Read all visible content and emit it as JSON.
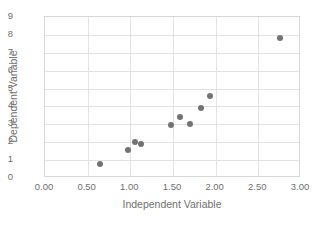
{
  "chart_data": {
    "type": "scatter",
    "title": "",
    "xlabel": "Independent Variable",
    "ylabel": "Dependent Variable",
    "xlim": [
      0.0,
      3.0
    ],
    "ylim": [
      0,
      9
    ],
    "xticks": [
      "0.00",
      "0.50",
      "1.00",
      "1.50",
      "2.00",
      "2.50",
      "3.00"
    ],
    "xtick_values": [
      0.0,
      0.5,
      1.0,
      1.5,
      2.0,
      2.5,
      3.0
    ],
    "yticks": [
      "0",
      "1",
      "2",
      "3",
      "4",
      "5",
      "6",
      "7",
      "8",
      "9"
    ],
    "ytick_values": [
      0,
      1,
      2,
      3,
      4,
      5,
      6,
      7,
      8,
      9
    ],
    "grid": "horizontal-and-vertical",
    "legend": "none",
    "marker_color": "#737373",
    "gridline_color": "#e2e2e2",
    "frame_color": "#d6d6d6",
    "text_color": "#6f6f6f",
    "series": [
      {
        "name": "data",
        "points": [
          {
            "x": 0.65,
            "y": 0.8
          },
          {
            "x": 0.97,
            "y": 1.55
          },
          {
            "x": 1.05,
            "y": 2.03
          },
          {
            "x": 1.13,
            "y": 1.9
          },
          {
            "x": 1.48,
            "y": 2.95
          },
          {
            "x": 1.58,
            "y": 3.4
          },
          {
            "x": 1.7,
            "y": 3.03
          },
          {
            "x": 1.83,
            "y": 3.92
          },
          {
            "x": 1.93,
            "y": 4.6
          },
          {
            "x": 2.75,
            "y": 7.8
          }
        ]
      }
    ]
  }
}
